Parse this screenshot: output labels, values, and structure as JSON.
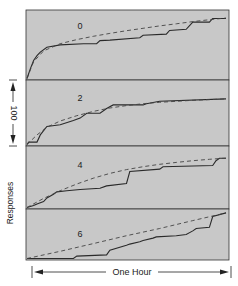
{
  "figure": {
    "ylabel": "Responses",
    "scale_bar_label": "100",
    "xlabel": "One Hour",
    "panel_bg": "#c8c8c8",
    "line_color": "#2a2a2a",
    "dash_color": "#444444"
  },
  "chart_data": {
    "type": "line",
    "title": "",
    "xlabel": "One Hour",
    "ylabel": "Responses",
    "scale_bar": {
      "value": 100,
      "unit": "responses"
    },
    "grid": false,
    "legend": "inline labels per panel",
    "x_range": [
      0,
      60
    ],
    "x_unit": "minutes",
    "panels": [
      {
        "label": "0",
        "series": [
          {
            "name": "cumulative record (solid)",
            "style": "solid",
            "x": [
              0,
              1,
              2,
              3,
              4,
              6,
              10,
              17,
              21,
              22,
              25,
              34,
              35,
              42,
              43,
              48,
              50,
              55,
              56,
              60
            ],
            "y": [
              0,
              40,
              75,
              95,
              110,
              130,
              140,
              145,
              145,
              158,
              160,
              170,
              180,
              185,
              200,
              205,
              235,
              235,
              250,
              250
            ]
          },
          {
            "name": "smoothed curve (dashed)",
            "style": "dashed",
            "x": [
              0,
              2,
              5,
              10,
              15,
              20,
              25,
              30,
              35,
              40,
              45,
              50,
              55,
              60
            ],
            "y": [
              0,
              70,
              115,
              145,
              162,
              176,
              188,
              199,
              209,
              219,
              228,
              237,
              245,
              252
            ]
          }
        ]
      },
      {
        "label": "2",
        "series": [
          {
            "name": "cumulative record (solid)",
            "style": "solid",
            "x": [
              0,
              0.5,
              3,
              4,
              6,
              10,
              14,
              16,
              18,
              22,
              24,
              26,
              35,
              36,
              38,
              40,
              60
            ],
            "y": [
              0,
              10,
              10,
              40,
              75,
              82,
              100,
              110,
              130,
              130,
              150,
              165,
              165,
              170,
              175,
              180,
              190
            ]
          },
          {
            "name": "smoothed curve (dashed)",
            "style": "dashed",
            "x": [
              0,
              3,
              6,
              10,
              15,
              20,
              25,
              30,
              35,
              40,
              45,
              50,
              55,
              60
            ],
            "y": [
              0,
              40,
              72,
              98,
              120,
              138,
              152,
              162,
              170,
              176,
              180,
              184,
              187,
              190
            ]
          }
        ]
      },
      {
        "label": "4",
        "series": [
          {
            "name": "cumulative record (solid)",
            "style": "solid",
            "x": [
              0,
              2,
              3,
              5,
              6,
              8,
              9,
              12,
              16,
              22,
              24,
              30,
              31,
              40,
              41,
              56,
              57,
              58,
              60
            ],
            "y": [
              0,
              8,
              15,
              25,
              40,
              55,
              65,
              70,
              75,
              80,
              90,
              100,
              150,
              160,
              170,
              175,
              195,
              205,
              205
            ]
          },
          {
            "name": "smoothed curve (dashed)",
            "style": "dashed",
            "x": [
              0,
              5,
              10,
              15,
              20,
              25,
              30,
              35,
              40,
              45,
              50,
              55,
              60
            ],
            "y": [
              0,
              38,
              70,
              98,
              122,
              142,
              158,
              170,
              180,
              188,
              195,
              201,
              206
            ]
          }
        ]
      },
      {
        "label": "6",
        "series": [
          {
            "name": "cumulative record (solid)",
            "style": "solid",
            "x": [
              0,
              14,
              15,
              24,
              25,
              30,
              31,
              34,
              35,
              38,
              39,
              45,
              48,
              50,
              51,
              55,
              56,
              60
            ],
            "y": [
              0,
              0,
              10,
              15,
              35,
              55,
              60,
              70,
              75,
              85,
              90,
              95,
              100,
              115,
              125,
              130,
              175,
              190
            ]
          },
          {
            "name": "smoothed curve (dashed)",
            "style": "dashed",
            "x": [
              0,
              10,
              20,
              30,
              40,
              50,
              60
            ],
            "y": [
              0,
              30,
              62,
              95,
              125,
              158,
              190
            ]
          }
        ]
      }
    ]
  }
}
